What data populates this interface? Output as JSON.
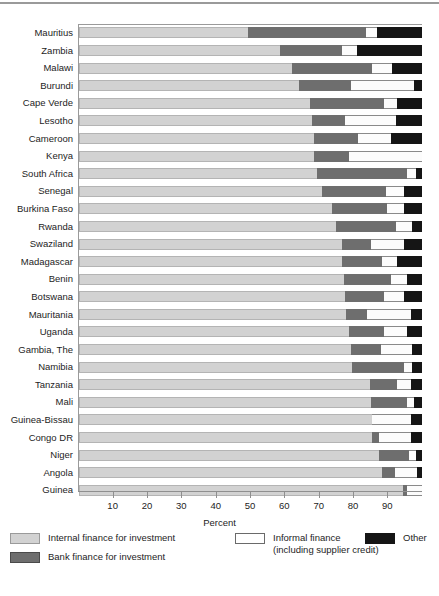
{
  "chart_data": {
    "type": "bar",
    "orientation": "horizontal",
    "stacked": true,
    "title": "",
    "xlabel": "Percent",
    "ylabel": "",
    "xlim": [
      0,
      100
    ],
    "xticks": [
      10,
      20,
      30,
      40,
      50,
      60,
      70,
      80,
      90
    ],
    "grid": false,
    "legend_position": "bottom",
    "categories": [
      "Mauritius",
      "Zambia",
      "Malawi",
      "Burundi",
      "Cape Verde",
      "Lesotho",
      "Cameroon",
      "Kenya",
      "South Africa",
      "Senegal",
      "Burkina Faso",
      "Rwanda",
      "Swaziland",
      "Madagascar",
      "Benin",
      "Botswana",
      "Mauritania",
      "Uganda",
      "Gambia, The",
      "Namibia",
      "Tanzania",
      "Mali",
      "Guinea-Bissau",
      "Congo DR",
      "Niger",
      "Angola",
      "Guinea"
    ],
    "series": [
      {
        "name": "Internal finance for investment",
        "color": "#d2d2d2",
        "values": [
          49.4,
          58.7,
          62.0,
          64.1,
          67.3,
          67.9,
          68.5,
          68.5,
          69.4,
          70.9,
          73.7,
          74.9,
          76.7,
          76.7,
          77.2,
          77.5,
          77.8,
          78.7,
          79.3,
          79.6,
          84.8,
          85.1,
          85.4,
          85.4,
          87.5,
          88.3,
          94.5
        ]
      },
      {
        "name": "Bank finance for investment",
        "color": "#6e6e6e",
        "values": [
          34.3,
          18.0,
          23.4,
          15.2,
          21.6,
          9.6,
          12.9,
          10.2,
          26.3,
          18.6,
          16.1,
          17.5,
          8.4,
          11.6,
          13.7,
          11.4,
          6.2,
          10.2,
          8.7,
          15.2,
          7.9,
          10.6,
          0.0,
          2.1,
          8.7,
          3.8,
          1.2
        ]
      },
      {
        "name": "Informal finance (including supplier credit)",
        "color": "#ffffff",
        "values": [
          3.2,
          4.4,
          5.9,
          18.4,
          3.8,
          14.9,
          9.5,
          21.3,
          2.6,
          5.3,
          5.0,
          4.7,
          9.7,
          4.4,
          4.8,
          5.9,
          12.8,
          6.8,
          9.1,
          2.3,
          4.1,
          2.0,
          11.4,
          9.3,
          2.0,
          6.5,
          4.3
        ]
      },
      {
        "name": "Other",
        "color": "#151515",
        "values": [
          13.1,
          18.9,
          8.7,
          2.3,
          7.3,
          7.6,
          9.1,
          0.0,
          1.7,
          5.2,
          5.2,
          2.9,
          5.2,
          7.3,
          4.3,
          5.2,
          3.2,
          4.3,
          2.9,
          2.9,
          3.2,
          2.3,
          3.2,
          3.2,
          1.8,
          1.4,
          0.0
        ]
      }
    ]
  },
  "legend": {
    "items": [
      {
        "label": "Internal finance for investment",
        "sub": "",
        "swatch": "internal"
      },
      {
        "label": "Bank finance for investment",
        "sub": "",
        "swatch": "bank"
      },
      {
        "label": "Informal finance",
        "sub": "(including supplier credit)",
        "swatch": "informal"
      },
      {
        "label": "Other",
        "sub": "",
        "swatch": "other"
      }
    ]
  }
}
